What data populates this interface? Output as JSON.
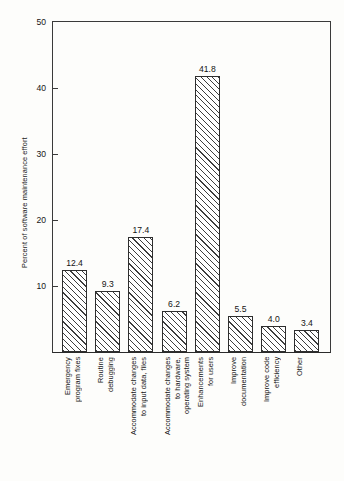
{
  "chart_data": {
    "type": "bar",
    "title": "",
    "xlabel": "",
    "ylabel": "Percent of software maintenance effort",
    "ylim": [
      0,
      50
    ],
    "yticks": [
      10,
      20,
      30,
      40,
      50
    ],
    "ytick_labels": [
      "10",
      "20",
      "30",
      "40",
      "50"
    ],
    "grid": false,
    "legend": false,
    "categories": [
      "Emergency\nprogram fixes",
      "Routine\ndebugging",
      "Accommodate changes\nto input data, files",
      "Accommodate changes\nto hardware,\noperating system",
      "Enhancements\nfor users",
      "Improve\ndocumentation",
      "Improve code\nefficiency",
      "Other"
    ],
    "values": [
      12.4,
      9.3,
      17.4,
      6.2,
      41.8,
      5.5,
      4.0,
      3.4
    ],
    "value_labels": [
      "12.4",
      "9.3",
      "17.4",
      "6.2",
      "41.8",
      "5.5",
      "4.0",
      "3.4"
    ],
    "bar_style": {
      "fill": "diagonal-hatch",
      "edge_color": "#2e2e2e",
      "face_color": "#ffffff"
    }
  },
  "colors": {
    "axis": "#3a3a3a",
    "text": "#161616",
    "background": "#fdfdfb"
  }
}
